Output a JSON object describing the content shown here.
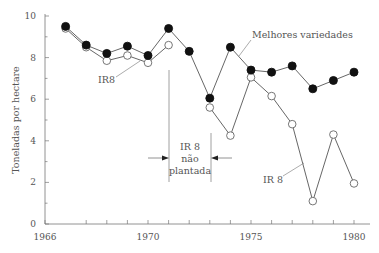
{
  "chart_data": {
    "type": "line",
    "title": "",
    "xlabel": "",
    "ylabel": "Toneladas por hectare",
    "xlim": [
      1965,
      1980.7
    ],
    "ylim": [
      0,
      10
    ],
    "x_ticks": [
      1966,
      1970,
      1975,
      1980
    ],
    "x_minor_ticks": [
      1966,
      1967,
      1968,
      1969,
      1970,
      1971,
      1972,
      1973,
      1974,
      1975,
      1976,
      1977,
      1978,
      1979,
      1980
    ],
    "y_ticks": [
      0,
      2,
      4,
      6,
      8,
      10
    ],
    "grid": false,
    "legend": "none (inline labels)",
    "x": [
      1966,
      1967,
      1968,
      1969,
      1970,
      1971,
      1972,
      1973,
      1974,
      1975,
      1976,
      1977,
      1978,
      1979,
      1980
    ],
    "series": [
      {
        "name": "Melhores variedades",
        "marker": "filled-circle",
        "values": [
          9.5,
          8.6,
          8.2,
          8.55,
          8.1,
          9.4,
          8.3,
          6.05,
          8.5,
          7.4,
          7.3,
          7.6,
          6.5,
          6.9,
          7.3
        ]
      },
      {
        "name": "IR 8",
        "marker": "open-circle",
        "values": [
          9.4,
          8.5,
          7.85,
          8.1,
          7.75,
          8.6,
          null,
          5.6,
          4.25,
          7.05,
          6.15,
          4.8,
          1.1,
          4.3,
          1.95
        ]
      }
    ],
    "annotations": [
      {
        "text": "Melhores variedades",
        "target_series": "Melhores variedades",
        "near_x": 1974.5
      },
      {
        "text": "IR8",
        "target_series": "IR 8",
        "near_x": 1969.5
      },
      {
        "text": "IR 8",
        "target_series": "IR 8",
        "near_x": 1977.5
      },
      {
        "text": "IR 8 não plantada",
        "span": [
          1971,
          1973
        ],
        "type": "bracket-arrows"
      }
    ]
  },
  "labels": {
    "ylabel": "Toneladas por hectare",
    "melhores": "Melhores variedades",
    "ir8_upper": "IR8",
    "ir8_lower": "IR 8",
    "gap_line1": "IR 8",
    "gap_line2": "não",
    "gap_line3": "plantada"
  },
  "colors": {
    "line": "#555555",
    "filled_marker": "#111111",
    "open_marker_fill": "#ffffff",
    "axis": "#777777",
    "text": "#555555"
  }
}
